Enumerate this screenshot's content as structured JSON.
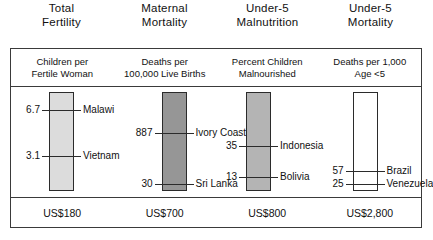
{
  "chart_data": {
    "type": "bar",
    "title": "",
    "xlabel": "",
    "ylabel": "",
    "grid": false,
    "legend": "none",
    "columns": [
      {
        "header_line1": "Total",
        "header_line2": "Fertility",
        "subtitle_line1": "Children per",
        "subtitle_line2": "Fertile Woman",
        "bar_fill": "#dcdcdc",
        "bar_stroke": "#2b2b2b",
        "cost": "US$180",
        "markers": [
          {
            "value": "6.7",
            "label": "Malawi",
            "pos_pct": 18
          },
          {
            "value": "3.1",
            "label": "Vietnam",
            "pos_pct": 65
          }
        ]
      },
      {
        "header_line1": "Maternal",
        "header_line2": "Mortality",
        "subtitle_line1": "Deaths per",
        "subtitle_line2": "100,000 Live Births",
        "bar_fill": "#969696",
        "bar_stroke": "#2b2b2b",
        "cost": "US$700",
        "markers": [
          {
            "value": "887",
            "label": "Ivory Coast",
            "pos_pct": 41
          },
          {
            "value": "30",
            "label": "Sri Lanka",
            "pos_pct": 93
          }
        ]
      },
      {
        "header_line1": "Under-5",
        "header_line2": "Malnutrition",
        "subtitle_line1": "Percent Children",
        "subtitle_line2": "Malnourished",
        "bar_fill": "#b4b4b4",
        "bar_stroke": "#2b2b2b",
        "cost": "US$800",
        "markers": [
          {
            "value": "35",
            "label": "Indonesia",
            "pos_pct": 55
          },
          {
            "value": "13",
            "label": "Bolivia",
            "pos_pct": 86
          }
        ]
      },
      {
        "header_line1": "Under-5",
        "header_line2": "Mortality",
        "subtitle_line1": "Deaths per 1,000",
        "subtitle_line2": "Age <5",
        "bar_fill": "#ffffff",
        "bar_stroke": "#2b2b2b",
        "cost": "US$2,800",
        "markers": [
          {
            "value": "57",
            "label": "Brazil",
            "pos_pct": 80
          },
          {
            "value": "25",
            "label": "Venezuela",
            "pos_pct": 93
          }
        ]
      }
    ]
  }
}
